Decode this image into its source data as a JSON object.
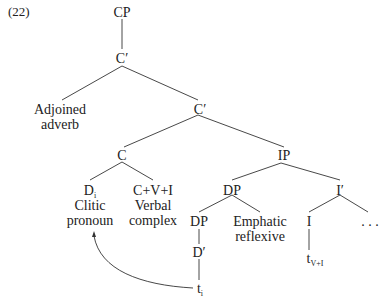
{
  "example_number": "(22)",
  "nodes": {
    "cp": "CP",
    "c_bar_top": "C′",
    "adjoined_1": "Adjoined",
    "adjoined_2": "adverb",
    "c_bar_mid": "C′",
    "c": "C",
    "ip": "IP",
    "d_main": "D",
    "d_sub": "i",
    "clitic_1": "Clitic",
    "clitic_2": "pronoun",
    "cvi": "C+V+I",
    "verbal_1": "Verbal",
    "verbal_2": "complex",
    "dp_ip": "DP",
    "i_bar": "I′",
    "dp_inner": "DP",
    "emphatic_1": "Emphatic",
    "emphatic_2": "reflexive",
    "i": "I",
    "ellipsis": ". . .",
    "d_bar": "D′",
    "t_vi_main": "t",
    "t_vi_sub": "V+I",
    "t_i_main": "t",
    "t_i_sub": "i"
  },
  "colors": {
    "line": "#333333",
    "text": "#222222"
  }
}
